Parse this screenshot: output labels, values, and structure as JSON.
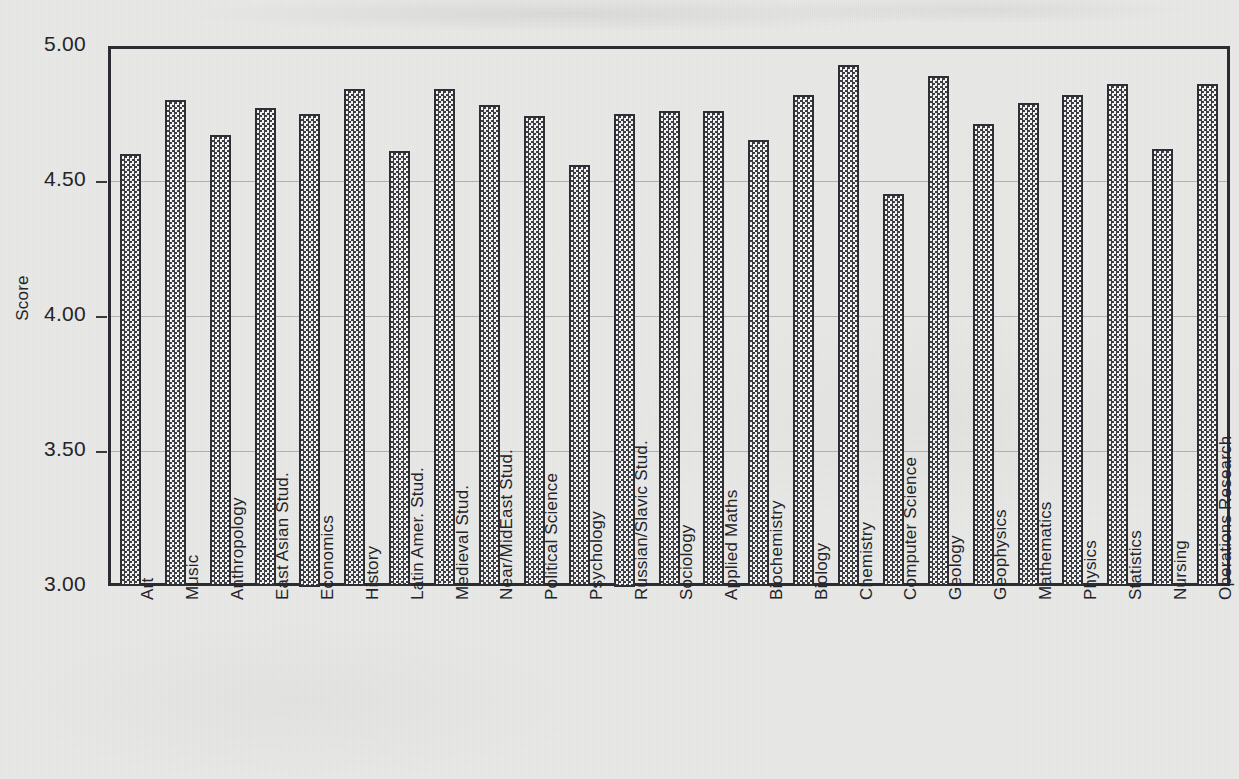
{
  "chart_data": {
    "type": "bar",
    "title": "",
    "xlabel": "",
    "ylabel": "Score",
    "ylim": [
      3.0,
      5.0
    ],
    "ytick_labels": [
      "5.00",
      "4.50",
      "4.00",
      "3.50",
      "3.00"
    ],
    "yticks": [
      5.0,
      4.5,
      4.0,
      3.5,
      3.0
    ],
    "grid": true,
    "legend": "none",
    "bar_fill": "checkerboard",
    "categories": [
      "Art",
      "Music",
      "Anthropology",
      "East Asian Stud.",
      "Economics",
      "History",
      "Latin Amer. Stud.",
      "Medieval Stud.",
      "Near/MidEast Stud.",
      "Political  Science",
      "Psychology",
      "Russian/Slavic Stud.",
      "Sociology",
      "Applied Maths",
      "Biochemistry",
      "Biology",
      "Chemistry",
      "Computer Science",
      "Geology",
      "Geophysics",
      "Mathematics",
      "Physics",
      "Statistics",
      "Nursing",
      "Operations Research"
    ],
    "values": [
      4.6,
      4.8,
      4.67,
      4.77,
      4.75,
      4.84,
      4.61,
      4.84,
      4.78,
      4.74,
      4.56,
      4.75,
      4.76,
      4.76,
      4.65,
      4.82,
      4.93,
      4.45,
      4.89,
      4.71,
      4.79,
      4.82,
      4.86,
      4.62,
      4.86
    ]
  },
  "colors": {
    "background": "#e9e9e7",
    "axis": "#2b2c31",
    "bar_border": "#2e2f34",
    "bar_fill_dark": "#3d3e43",
    "bar_fill_light": "#f2f2f0",
    "gridline": "#6e6e70",
    "text": "#23242a"
  }
}
